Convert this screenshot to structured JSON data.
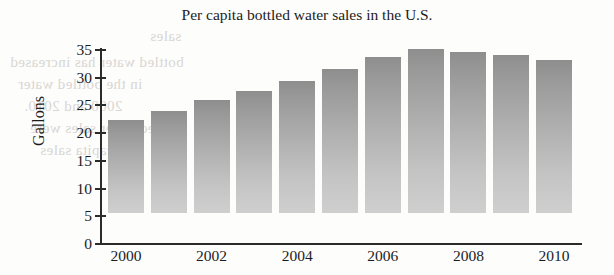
{
  "chart_data": {
    "type": "bar",
    "title": "Per capita bottled water sales in the U.S.",
    "xlabel": "",
    "ylabel": "Gallons",
    "categories": [
      "2000",
      "2001",
      "2002",
      "2003",
      "2004",
      "2005",
      "2006",
      "2007",
      "2008",
      "2009",
      "2010"
    ],
    "values": [
      16.8,
      18.4,
      20.4,
      22.0,
      23.8,
      26.0,
      28.2,
      29.6,
      29.1,
      28.5,
      27.6
    ],
    "ylim": [
      0,
      35
    ],
    "ytick_values": [
      0,
      5,
      10,
      15,
      20,
      25,
      30,
      35
    ],
    "ytick_labels": [
      "0",
      "5",
      "10",
      "15",
      "20",
      "25",
      "30",
      "35"
    ],
    "xtick_labels": [
      "2000",
      "2002",
      "2004",
      "2006",
      "2008",
      "2010"
    ],
    "xtick_categories": [
      "2000",
      "2002",
      "2004",
      "2006",
      "2008",
      "2010"
    ],
    "grid": false,
    "legend": null,
    "bar_color_top": "#8e8e8e",
    "bar_color_bottom": "#cfcfcf",
    "axis_color": "#2b2b2b",
    "background": "#fdfdfc"
  },
  "bleed_through": {
    "line1": "sales",
    "line2": "bottled water has increased",
    "line3": "in the bottled water",
    "line4": "2000 and 2010.",
    "line5": "bottled water sales were",
    "line6": "per capita sales"
  }
}
